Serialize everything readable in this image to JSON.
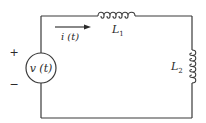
{
  "diagram": {
    "type": "series RL circuit",
    "source": {
      "label": "v (t)",
      "polarity_plus": "+",
      "polarity_minus": "−"
    },
    "current": {
      "label": "i (t)",
      "direction": "clockwise"
    },
    "inductor_1": {
      "label_main": "L",
      "label_sub": "1",
      "position": "top wire"
    },
    "inductor_2": {
      "label_main": "L",
      "label_sub": "2",
      "position": "right wire"
    },
    "colors": {
      "wire": "#3a3a3a",
      "text": "#2a2a2a",
      "background": "#ffffff"
    }
  }
}
